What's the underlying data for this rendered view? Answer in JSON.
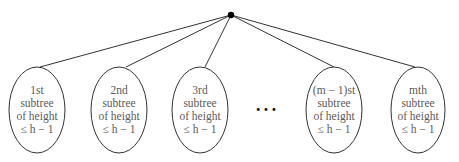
{
  "diagram": {
    "type": "tree",
    "root": {
      "x": 231,
      "y": 15
    },
    "ellipse": {
      "rx": 28,
      "ry": 43,
      "cy": 110,
      "top_y": 67
    },
    "subtrees": [
      {
        "cx": 37,
        "line1": "1st",
        "line2": "subtree",
        "line3": "of height",
        "line4": "≤ h − 1"
      },
      {
        "cx": 119,
        "line1": "2nd",
        "line2": "subtree",
        "line3": "of height",
        "line4": "≤ h − 1"
      },
      {
        "cx": 200,
        "line1": "3rd",
        "line2": "subtree",
        "line3": "of height",
        "line4": "≤ h − 1"
      },
      {
        "cx": 334,
        "line1": "(m − 1)st",
        "line2": "subtree",
        "line3": "of height",
        "line4": "≤ h − 1"
      },
      {
        "cx": 418,
        "line1": "mth",
        "line2": "subtree",
        "line3": "of height",
        "line4": "≤ h − 1"
      }
    ],
    "ellipsis": "•••",
    "colors": {
      "stroke": "#333333",
      "text": "#5a5a5a",
      "node": "#000000"
    }
  }
}
